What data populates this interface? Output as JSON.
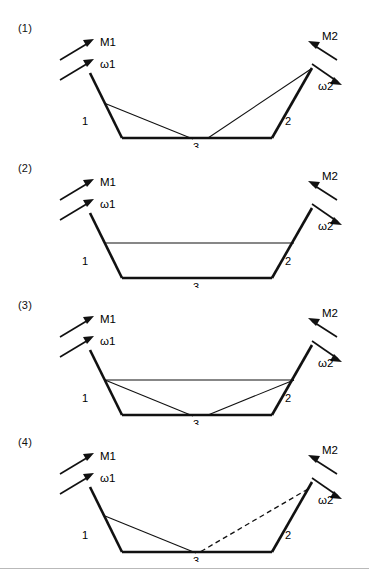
{
  "figure": {
    "background_color": "#ffffff",
    "line_color": "#111111",
    "rule_color": "#b9b9b9",
    "width": 369,
    "height": 578
  },
  "panels": [
    {
      "id": "panel-1",
      "label": "(1)",
      "labels": {
        "mirror1": "M1",
        "omega1": "ω1",
        "mirror2": "M2",
        "omega2": "ω2",
        "element1": "1",
        "element2": "2",
        "element3": "3"
      },
      "description": "Two inner rays from top of mirror 1 and top of mirror 2 crossing over the bottom mirror 3",
      "inner_paths": [
        "solid-left-diagonal",
        "solid-right-diagonal"
      ]
    },
    {
      "id": "panel-2",
      "label": "(2)",
      "labels": {
        "mirror1": "M1",
        "omega1": "ω1",
        "mirror2": "M2",
        "omega2": "ω2",
        "element1": "1",
        "element2": "2",
        "element3": "3"
      },
      "description": "Single horizontal ray connecting mirror 1 to mirror 2",
      "inner_paths": [
        "solid-horizontal"
      ]
    },
    {
      "id": "panel-3",
      "label": "(3)",
      "labels": {
        "mirror1": "M1",
        "omega1": "ω1",
        "mirror2": "M2",
        "omega2": "ω2",
        "element1": "1",
        "element2": "2",
        "element3": "3"
      },
      "description": "Horizontal ray plus two crossing diagonals over the bottom mirror 3",
      "inner_paths": [
        "solid-horizontal",
        "solid-left-diagonal",
        "solid-right-diagonal"
      ]
    },
    {
      "id": "panel-4",
      "label": "(4)",
      "labels": {
        "mirror1": "M1",
        "omega1": "ω1",
        "mirror2": "M2",
        "omega2": "ω2",
        "element1": "1",
        "element2": "2",
        "element3": "3"
      },
      "description": "Solid diagonal from mirror 1 to bottom mirror, dashed diagonal from bottom mirror to mirror 2",
      "inner_paths": [
        "solid-left-diagonal",
        "dashed-right-diagonal"
      ]
    }
  ]
}
